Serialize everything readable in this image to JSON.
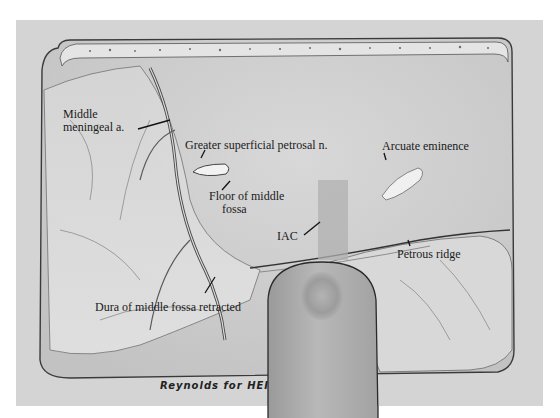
{
  "figure": {
    "background_color": "#ffffff",
    "frame_color": "#d6d6d6",
    "field_color": "#cfcfcf",
    "ink_color": "#1a1a1a"
  },
  "labels": {
    "middle_meningeal_line1": "Middle",
    "middle_meningeal_line2": "meningeal a.",
    "greater_superficial_petrosal": "Greater superficial petrosal n.",
    "floor_line1": "Floor of middle",
    "floor_line2": "fossa",
    "arcuate_eminence": "Arcuate eminence",
    "iac": "IAC",
    "petrous_ridge": "Petrous ridge",
    "dura_retracted": "Dura of middle fossa retracted"
  },
  "signature": "Reynolds for HEI",
  "structures": [
    {
      "name": "bone-flap-edge",
      "description": "Top edge of craniotomy with bone margin"
    },
    {
      "name": "middle-meningeal-artery",
      "description": "Vessel running down left side"
    },
    {
      "name": "greater-superficial-petrosal-nerve",
      "description": "Small white nerve segment"
    },
    {
      "name": "arcuate-eminence",
      "description": "White oblong eminence at right"
    },
    {
      "name": "iac",
      "description": "Shaded rectangle over internal auditory canal"
    },
    {
      "name": "petrous-ridge",
      "description": "Ridge along right inferior"
    },
    {
      "name": "retractor",
      "description": "Rounded retractor blade at bottom center"
    }
  ]
}
